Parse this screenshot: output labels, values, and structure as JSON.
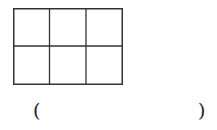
{
  "diagram": {
    "type": "grid",
    "rows": 2,
    "columns": 3,
    "line_color": "#333333"
  },
  "answer": {
    "open_paren": "(",
    "close_paren": ")",
    "value": ""
  }
}
